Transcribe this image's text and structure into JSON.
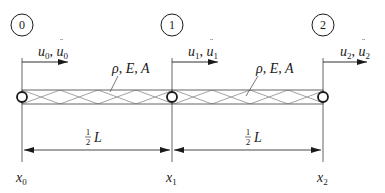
{
  "diagram": {
    "type": "two-element axial bar finite element model",
    "colors": {
      "line": "#1a1a1a",
      "thin": "#555555",
      "hatch": "#8a8a8a"
    },
    "nodes": [
      {
        "id": "0",
        "label": "0",
        "x": 22,
        "disp": "u",
        "sub": "0",
        "coord": "x",
        "coord_sub": "0"
      },
      {
        "id": "1",
        "label": "1",
        "x": 172,
        "disp": "u",
        "sub": "1",
        "coord": "x",
        "coord_sub": "1"
      },
      {
        "id": "2",
        "label": "2",
        "x": 323,
        "disp": "u",
        "sub": "2",
        "coord": "x",
        "coord_sub": "2"
      }
    ],
    "elements": [
      {
        "props": "ρ, E, A",
        "length_label": "1",
        "length_den": "2",
        "length_var": "L"
      },
      {
        "props": "ρ, E, A",
        "length_label": "1",
        "length_den": "2",
        "length_var": "L"
      }
    ],
    "disp_sep": ", ",
    "bar": {
      "y_top": 90,
      "y_bottom": 104
    },
    "dimension_y": 150
  }
}
